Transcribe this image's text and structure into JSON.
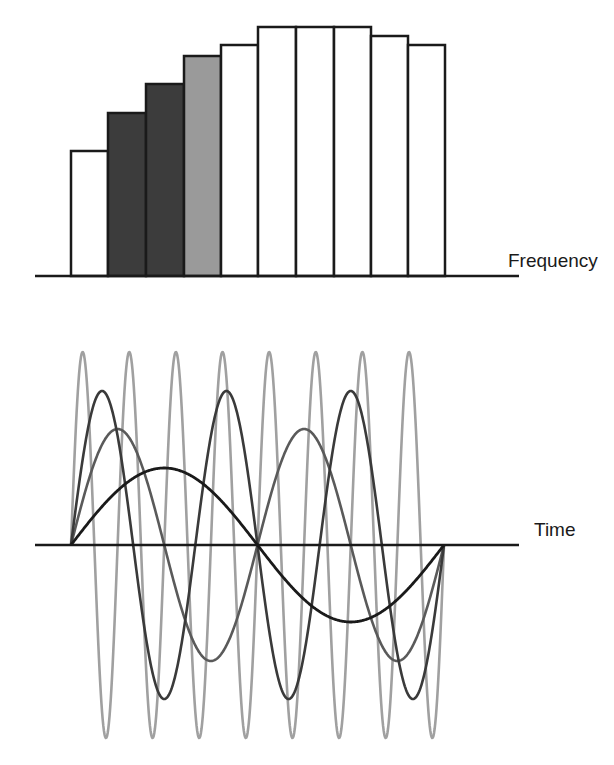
{
  "labels": {
    "frequency_axis": "Frequency",
    "time_axis": "Time"
  },
  "colors": {
    "background": "#ffffff",
    "outline": "#1a1a1a",
    "bar_white": "#ffffff",
    "bar_dark": "#3c3c3c",
    "bar_mid": "#9a9a9a",
    "wave_fundamental": "#1a1a1a",
    "wave_second": "#5a5a5a",
    "wave_third": "#3a3a3a",
    "wave_eighth": "#a0a0a0"
  },
  "spectrum": {
    "baseline_y": 276,
    "axis_x_start": 35,
    "axis_x_end": 519,
    "bar_edges_x": [
      71,
      108,
      146,
      184,
      221,
      258,
      296,
      334,
      371,
      408,
      445
    ],
    "bars": [
      {
        "top_y": 151,
        "fill": "bar_white"
      },
      {
        "top_y": 113,
        "fill": "bar_dark"
      },
      {
        "top_y": 84,
        "fill": "bar_dark"
      },
      {
        "top_y": 56,
        "fill": "bar_mid"
      },
      {
        "top_y": 45,
        "fill": "bar_white"
      },
      {
        "top_y": 27,
        "fill": "bar_white"
      },
      {
        "top_y": 27,
        "fill": "bar_white"
      },
      {
        "top_y": 27,
        "fill": "bar_white"
      },
      {
        "top_y": 36,
        "fill": "bar_white"
      },
      {
        "top_y": 45,
        "fill": "bar_white"
      }
    ]
  },
  "waves": {
    "axis_y": 545,
    "axis_x_start": 35,
    "axis_x_end": 519,
    "x_start": 71,
    "x_end": 444,
    "components": [
      {
        "name": "eighth",
        "cycles": 8,
        "amplitude": 193,
        "color": "wave_eighth",
        "width": 2.6
      },
      {
        "name": "second",
        "cycles": 2,
        "amplitude": 116,
        "color": "wave_second",
        "width": 2.6
      },
      {
        "name": "third",
        "cycles": 3,
        "amplitude": 154,
        "color": "wave_third",
        "width": 2.6
      },
      {
        "name": "fundamental",
        "cycles": 1,
        "amplitude": 77,
        "color": "wave_fundamental",
        "width": 2.8
      }
    ]
  },
  "chart_data": {
    "type": "bar",
    "title": "",
    "xlabel": "Frequency",
    "ylabel": "",
    "categories": [
      "1",
      "2",
      "3",
      "4",
      "5",
      "6",
      "7",
      "8",
      "9",
      "10"
    ],
    "values": [
      125,
      163,
      192,
      220,
      231,
      249,
      249,
      249,
      240,
      231
    ],
    "highlighted": {
      "dark": [
        2,
        3
      ],
      "mid": [
        4
      ]
    },
    "grid": false,
    "note": "Values are bar heights in pixels above the frequency baseline; no numeric axis is shown."
  }
}
